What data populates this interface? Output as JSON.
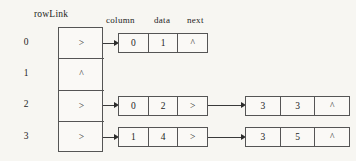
{
  "diagram": {
    "title": "rowLink",
    "node_headers": [
      "column",
      "data",
      "next"
    ],
    "null_symbol": "^",
    "pointer_symbol": ">",
    "row_indices": [
      "0",
      "1",
      "2",
      "3"
    ],
    "rows": [
      {
        "index": "0",
        "link_cell": ">",
        "nodes": [
          {
            "column": "0",
            "data": "1",
            "next": "^"
          }
        ]
      },
      {
        "index": "1",
        "link_cell": "^",
        "nodes": []
      },
      {
        "index": "2",
        "link_cell": ">",
        "nodes": [
          {
            "column": "0",
            "data": "2",
            "next": ">"
          },
          {
            "column": "3",
            "data": "3",
            "next": "^"
          }
        ]
      },
      {
        "index": "3",
        "link_cell": ">",
        "nodes": [
          {
            "column": "1",
            "data": "4",
            "next": ">"
          },
          {
            "column": "3",
            "data": "5",
            "next": "^"
          }
        ]
      }
    ],
    "colors": {
      "background": "#f7f6f2",
      "box_fill": "#faf9f6",
      "stroke": "#555555",
      "text": "#1d1d1d",
      "arrow": "#2b2b2b"
    }
  }
}
